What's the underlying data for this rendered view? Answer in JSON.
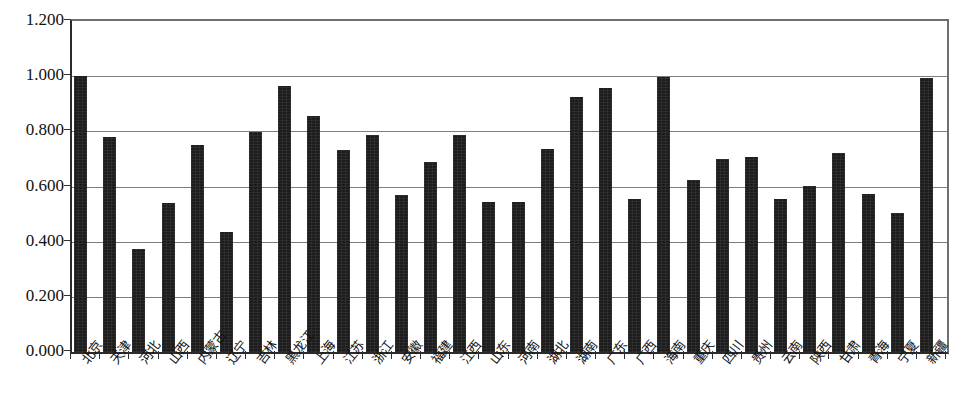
{
  "chart_data": {
    "type": "bar",
    "title": "",
    "subtitle": "",
    "xlabel": "",
    "ylabel": "",
    "ylim": [
      0.0,
      1.2
    ],
    "ytick_labels": [
      "0.000",
      "0.200",
      "0.400",
      "0.600",
      "0.800",
      "1.000",
      "1.200"
    ],
    "ytick_values": [
      0.0,
      0.2,
      0.4,
      0.6,
      0.8,
      1.0,
      1.2
    ],
    "grid": true,
    "grid_axis": "y",
    "legend": false,
    "legend_position": "none",
    "bar_color": "#1d1d1d",
    "plot_background": "#ffffff",
    "axis_color": "#2b2b2b",
    "gridline_color": "#7d7d7d",
    "categories": [
      "北京",
      "天津",
      "河北",
      "山西",
      "内蒙古",
      "辽宁",
      "吉林",
      "黑龙江",
      "上海",
      "江苏",
      "浙江",
      "安徽",
      "福建",
      "江西",
      "山东",
      "河南",
      "湖北",
      "湖南",
      "广东",
      "广西",
      "海南",
      "重庆",
      "四川",
      "贵州",
      "云南",
      "陕西",
      "甘肃",
      "青海",
      "宁夏",
      "新疆"
    ],
    "values": [
      1.0,
      0.778,
      0.375,
      0.54,
      0.75,
      0.435,
      0.797,
      0.965,
      0.855,
      0.731,
      0.787,
      0.568,
      0.688,
      0.785,
      0.545,
      0.545,
      0.735,
      0.924,
      0.957,
      0.556,
      0.996,
      0.622,
      0.698,
      0.706,
      0.556,
      0.6,
      0.723,
      0.574,
      0.504,
      0.995
    ]
  }
}
